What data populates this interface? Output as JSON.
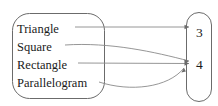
{
  "diagram": {
    "type": "mapping-diagram",
    "domain_set": {
      "name": "shapes-set",
      "shape": "rounded-rectangle",
      "items": [
        {
          "label": "Triangle",
          "x": 17,
          "y": 23
        },
        {
          "label": "Square",
          "x": 17,
          "y": 41
        },
        {
          "label": "Rectangle",
          "x": 17,
          "y": 59
        },
        {
          "label": "Parallelogram",
          "x": 17,
          "y": 77
        }
      ]
    },
    "codomain_set": {
      "name": "numbers-set",
      "shape": "rounded-oval",
      "items": [
        {
          "label": "3",
          "x": 196,
          "y": 26
        },
        {
          "label": "4",
          "x": 196,
          "y": 58
        }
      ]
    },
    "mappings": [
      {
        "from": "Triangle",
        "to": "3",
        "style": "straight"
      },
      {
        "from": "Square",
        "to": "4",
        "style": "curve-down"
      },
      {
        "from": "Rectangle",
        "to": "4",
        "style": "straight"
      },
      {
        "from": "Parallelogram",
        "to": "4",
        "style": "curve-arc-below"
      }
    ],
    "colors": {
      "outline": "#6b6b6b",
      "connector": "#8a8a8a",
      "text": "#1a1a1a",
      "background": "#ffffff"
    }
  }
}
